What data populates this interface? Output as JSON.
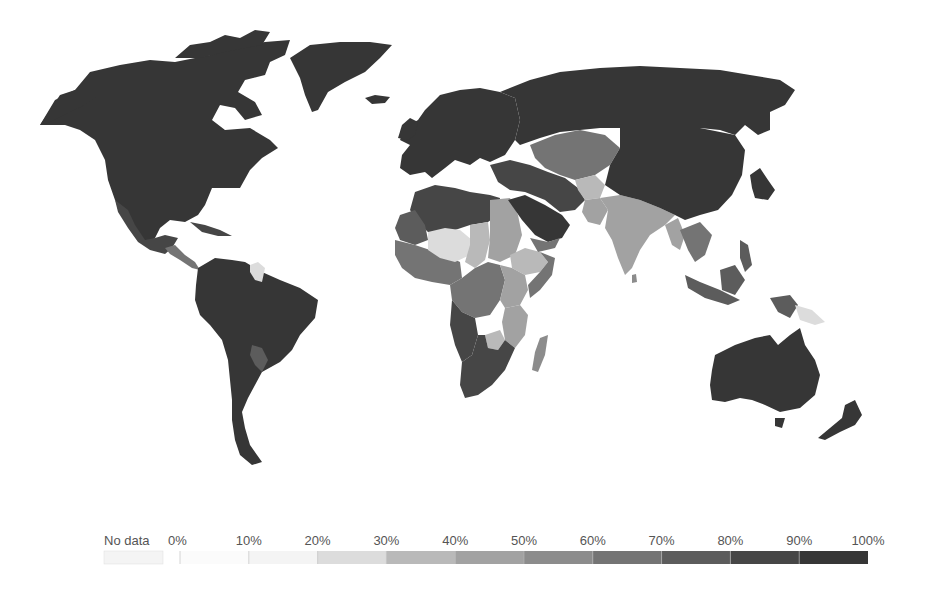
{
  "chart_data": {
    "type": "choropleth",
    "title": "",
    "legend": {
      "placement": "bottom",
      "no_data_label": "No data",
      "no_data_color": "#f4f4f4",
      "ticks": [
        "0%",
        "10%",
        "20%",
        "30%",
        "40%",
        "50%",
        "60%",
        "70%",
        "80%",
        "90%",
        "100%"
      ],
      "bins": [
        {
          "range": [
            0,
            10
          ],
          "color": "#fbfbfb"
        },
        {
          "range": [
            10,
            20
          ],
          "color": "#f4f4f4"
        },
        {
          "range": [
            20,
            30
          ],
          "color": "#dcdcdc"
        },
        {
          "range": [
            30,
            40
          ],
          "color": "#b9b9b9"
        },
        {
          "range": [
            40,
            50
          ],
          "color": "#a2a2a2"
        },
        {
          "range": [
            50,
            60
          ],
          "color": "#8c8c8c"
        },
        {
          "range": [
            60,
            70
          ],
          "color": "#747474"
        },
        {
          "range": [
            70,
            80
          ],
          "color": "#5c5c5c"
        },
        {
          "range": [
            80,
            90
          ],
          "color": "#464646"
        },
        {
          "range": [
            90,
            100
          ],
          "color": "#363636"
        }
      ]
    },
    "regions": [
      {
        "name": "North America",
        "value": 95
      },
      {
        "name": "Greenland",
        "value": 95
      },
      {
        "name": "Iceland",
        "value": 95
      },
      {
        "name": "Mexico & Central America",
        "value": 85
      },
      {
        "name": "Central America south",
        "value": 65
      },
      {
        "name": "Caribbean",
        "value": 85
      },
      {
        "name": "South America",
        "value": 92
      },
      {
        "name": "Guyana/Suriname",
        "value": 28
      },
      {
        "name": "Paraguay",
        "value": 75
      },
      {
        "name": "Europe",
        "value": 95
      },
      {
        "name": "Russia",
        "value": 95
      },
      {
        "name": "North Africa",
        "value": 88
      },
      {
        "name": "Mauritania",
        "value": 72
      },
      {
        "name": "West Africa coast",
        "value": 62
      },
      {
        "name": "Mali/Niger",
        "value": 22
      },
      {
        "name": "Chad",
        "value": 35
      },
      {
        "name": "Sudan",
        "value": 48
      },
      {
        "name": "Ethiopia",
        "value": 30
      },
      {
        "name": "Somalia",
        "value": 60
      },
      {
        "name": "Central Africa",
        "value": 65
      },
      {
        "name": "Angola/Namibia",
        "value": 80
      },
      {
        "name": "East Africa",
        "value": 45
      },
      {
        "name": "Mozambique/Malawi",
        "value": 40
      },
      {
        "name": "Zimbabwe",
        "value": 35
      },
      {
        "name": "Southern Africa",
        "value": 82
      },
      {
        "name": "Madagascar",
        "value": 55
      },
      {
        "name": "Middle East",
        "value": 97
      },
      {
        "name": "Iran/Iraq/Turkey",
        "value": 88
      },
      {
        "name": "Yemen",
        "value": 62
      },
      {
        "name": "Central Asia",
        "value": 62
      },
      {
        "name": "Afghanistan",
        "value": 35
      },
      {
        "name": "Pakistan",
        "value": 45
      },
      {
        "name": "India",
        "value": 42
      },
      {
        "name": "China/Mongolia",
        "value": 92
      },
      {
        "name": "Japan/Korea",
        "value": 95
      },
      {
        "name": "Myanmar",
        "value": 45
      },
      {
        "name": "Southeast Asia",
        "value": 62
      },
      {
        "name": "Indonesia/Philippines",
        "value": 75
      },
      {
        "name": "Papua New Guinea",
        "value": 22
      },
      {
        "name": "Australia",
        "value": 95
      },
      {
        "name": "New Zealand",
        "value": 95
      },
      {
        "name": "Sri Lanka",
        "value": 55
      }
    ]
  }
}
